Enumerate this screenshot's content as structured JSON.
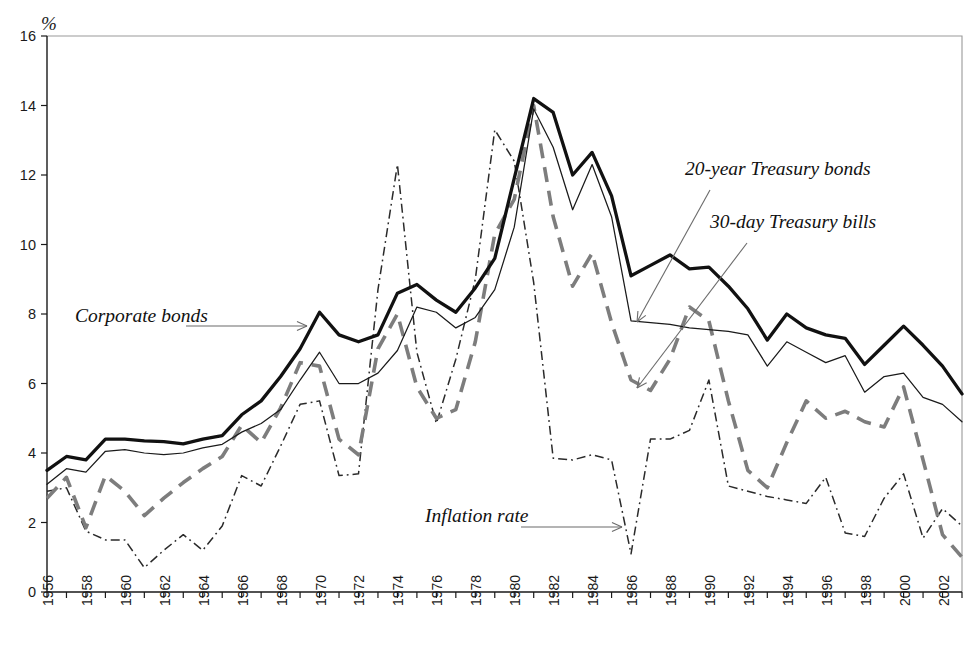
{
  "chart_data": {
    "type": "line",
    "title": "",
    "xlabel": "",
    "ylabel": "%",
    "y_unit_symbol": "%",
    "ylim": [
      0,
      16
    ],
    "xlim": [
      1956,
      2003
    ],
    "y_ticks": [
      0,
      2,
      4,
      6,
      8,
      10,
      12,
      14,
      16
    ],
    "x_ticks": [
      1956,
      1958,
      1960,
      1962,
      1964,
      1966,
      1968,
      1970,
      1972,
      1974,
      1976,
      1978,
      1980,
      1982,
      1984,
      1986,
      1988,
      1990,
      1992,
      1994,
      1996,
      1998,
      2000,
      2002
    ],
    "x_tick_labels": [
      "1956",
      "1958",
      "1960",
      "1962",
      "1964",
      "1966",
      "1968",
      "1970",
      "1972",
      "1974",
      "1976",
      "1978",
      "1980",
      "1982",
      "1984",
      "1986",
      "1988",
      "1990",
      "1992",
      "1994",
      "1996",
      "1998",
      "2000",
      "2002"
    ],
    "grid": false,
    "legend_position": "inline-annotations",
    "x": [
      1956,
      1957,
      1958,
      1959,
      1960,
      1961,
      1962,
      1963,
      1964,
      1965,
      1966,
      1967,
      1968,
      1969,
      1970,
      1971,
      1972,
      1973,
      1974,
      1975,
      1976,
      1977,
      1978,
      1979,
      1980,
      1981,
      1982,
      1983,
      1984,
      1985,
      1986,
      1987,
      1988,
      1989,
      1990,
      1991,
      1992,
      1993,
      1994,
      1995,
      1996,
      1997,
      1998,
      1999,
      2000,
      2001,
      2002,
      2003
    ],
    "series": [
      {
        "name": "Corporate bonds",
        "style": "thick-solid-black",
        "color": "#111111",
        "values": [
          3.5,
          3.9,
          3.8,
          4.4,
          4.4,
          4.35,
          4.33,
          4.26,
          4.4,
          4.5,
          5.1,
          5.5,
          6.2,
          7.0,
          8.05,
          7.4,
          7.2,
          7.4,
          8.6,
          8.85,
          8.4,
          8.05,
          8.75,
          9.6,
          11.9,
          14.2,
          13.8,
          12.0,
          12.65,
          11.4,
          9.1,
          9.4,
          9.7,
          9.3,
          9.35,
          8.8,
          8.15,
          7.25,
          8.0,
          7.6,
          7.4,
          7.3,
          6.55,
          7.1,
          7.65,
          7.1,
          6.5,
          5.7
        ]
      },
      {
        "name": "20-year Treasury bonds",
        "style": "thin-solid-black",
        "color": "#1a1a1a",
        "values": [
          3.1,
          3.55,
          3.45,
          4.05,
          4.1,
          4.0,
          3.95,
          4.0,
          4.15,
          4.25,
          4.6,
          4.85,
          5.25,
          6.1,
          6.9,
          6.0,
          6.0,
          6.3,
          6.95,
          8.2,
          8.05,
          7.6,
          7.9,
          8.7,
          10.5,
          13.9,
          12.8,
          11.0,
          12.3,
          10.8,
          7.8,
          7.75,
          7.7,
          7.6,
          7.55,
          7.5,
          7.4,
          6.5,
          7.2,
          6.9,
          6.6,
          6.8,
          5.75,
          6.2,
          6.3,
          5.6,
          5.4,
          4.9
        ]
      },
      {
        "name": "30-day Treasury bills",
        "style": "thick-dashed-gray",
        "color": "#7d7d7d",
        "values": [
          2.7,
          3.3,
          1.85,
          3.35,
          2.9,
          2.2,
          2.7,
          3.15,
          3.55,
          3.9,
          4.8,
          4.3,
          5.3,
          6.6,
          6.5,
          4.4,
          3.95,
          7.0,
          8.0,
          5.9,
          5.0,
          5.25,
          7.2,
          10.3,
          11.3,
          14.0,
          10.8,
          8.8,
          9.75,
          7.75,
          6.1,
          5.8,
          6.7,
          8.2,
          7.8,
          5.5,
          3.5,
          3.0,
          4.3,
          5.5,
          5.0,
          5.2,
          4.9,
          4.75,
          5.9,
          3.8,
          1.65,
          1.0
        ]
      },
      {
        "name": "Inflation rate",
        "style": "thin-dash-dot-black",
        "color": "#2a2a2a",
        "values": [
          2.9,
          3.0,
          1.75,
          1.5,
          1.5,
          0.7,
          1.2,
          1.65,
          1.2,
          1.9,
          3.35,
          3.05,
          4.2,
          5.4,
          5.5,
          3.35,
          3.4,
          8.7,
          12.3,
          6.9,
          4.85,
          6.7,
          9.0,
          13.3,
          12.4,
          8.9,
          3.85,
          3.8,
          3.95,
          3.8,
          1.1,
          4.4,
          4.4,
          4.65,
          6.1,
          3.05,
          2.9,
          2.75,
          2.65,
          2.55,
          3.3,
          1.7,
          1.6,
          2.7,
          3.4,
          1.55,
          2.4,
          1.9
        ]
      }
    ],
    "annotations": [
      {
        "name": "corporate-bonds-label",
        "text": "Corporate bonds",
        "target_series": "Corporate bonds"
      },
      {
        "name": "treasury-bonds-label",
        "text": "20-year Treasury bonds",
        "target_series": "20-year Treasury bonds"
      },
      {
        "name": "treasury-bills-label",
        "text": "30-day Treasury bills",
        "target_series": "30-day Treasury bills"
      },
      {
        "name": "inflation-rate-label",
        "text": "Inflation rate",
        "target_series": "Inflation rate"
      }
    ]
  },
  "axis": {
    "y_unit": "%",
    "y_labels": [
      "0",
      "2",
      "4",
      "6",
      "8",
      "10",
      "12",
      "14",
      "16"
    ],
    "x_labels": [
      "1956",
      "1958",
      "1960",
      "1962",
      "1964",
      "1966",
      "1968",
      "1970",
      "1972",
      "1974",
      "1976",
      "1978",
      "1980",
      "1982",
      "1984",
      "1986",
      "1988",
      "1990",
      "1992",
      "1994",
      "1996",
      "1998",
      "2000",
      "2002"
    ]
  },
  "labels": {
    "corporate_bonds": "Corporate bonds",
    "treasury_bonds_20y": "20-year Treasury bonds",
    "treasury_bills_30d": "30-day Treasury bills",
    "inflation_rate": "Inflation rate"
  },
  "colors": {
    "corporate": "#111111",
    "treasury": "#1a1a1a",
    "bills": "#7d7d7d",
    "inflation": "#2a2a2a",
    "frame": "#9a9a9a"
  }
}
